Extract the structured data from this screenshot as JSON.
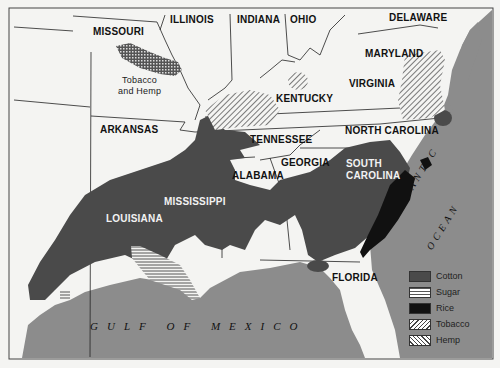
{
  "map": {
    "title": "Southern Agriculture Regions",
    "states": [
      {
        "name": "MISSOURI",
        "x": 93,
        "y": 26
      },
      {
        "name": "ILLINOIS",
        "x": 170,
        "y": 14
      },
      {
        "name": "INDIANA",
        "x": 237,
        "y": 14
      },
      {
        "name": "OHIO",
        "x": 290,
        "y": 14
      },
      {
        "name": "DELAWARE",
        "x": 389,
        "y": 12
      },
      {
        "name": "MARYLAND",
        "x": 365,
        "y": 48
      },
      {
        "name": "KENTUCKY",
        "x": 276,
        "y": 93
      },
      {
        "name": "VIRGINIA",
        "x": 349,
        "y": 78
      },
      {
        "name": "ARKANSAS",
        "x": 100,
        "y": 124
      },
      {
        "name": "TENNESSEE",
        "x": 250,
        "y": 134
      },
      {
        "name": "NORTH CAROLINA",
        "x": 345,
        "y": 125
      },
      {
        "name": "GEORGIA",
        "x": 281,
        "y": 157
      },
      {
        "name": "ALABAMA",
        "x": 232,
        "y": 170
      },
      {
        "name": "SOUTH CAROLINA",
        "x": 346,
        "y": 158
      },
      {
        "name": "MISSISSIPPI",
        "x": 164,
        "y": 196
      },
      {
        "name": "LOUISIANA",
        "x": 106,
        "y": 213
      },
      {
        "name": "FLORIDA",
        "x": 332,
        "y": 272
      }
    ],
    "white_labels": [
      "SOUTH CAROLINA",
      "MISSISSIPPI",
      "LOUISIANA"
    ],
    "annotation": {
      "line1": "Tobacco",
      "line2": "and Hemp",
      "x": 118,
      "y": 75
    },
    "water": {
      "gulf": "GULF OF MEXICO",
      "atlantic_1": "ATLANTIC",
      "atlantic_2": "OCEAN"
    }
  },
  "legend": {
    "items": [
      {
        "label": "Cotton",
        "pattern": "solid-dark",
        "color": "#4a4a4a"
      },
      {
        "label": "Sugar",
        "pattern": "horizontal-lines",
        "color": "#ffffff"
      },
      {
        "label": "Rice",
        "pattern": "solid-black",
        "color": "#111111"
      },
      {
        "label": "Tobacco",
        "pattern": "diagonal-lines",
        "color": "#ffffff"
      },
      {
        "label": "Hemp",
        "pattern": "cross-hatch",
        "color": "#ffffff"
      }
    ]
  },
  "colors": {
    "land": "#f4f4f2",
    "water": "#8c8c8c",
    "cotton": "#4a4a4a",
    "rice": "#111111",
    "border": "#222222"
  }
}
